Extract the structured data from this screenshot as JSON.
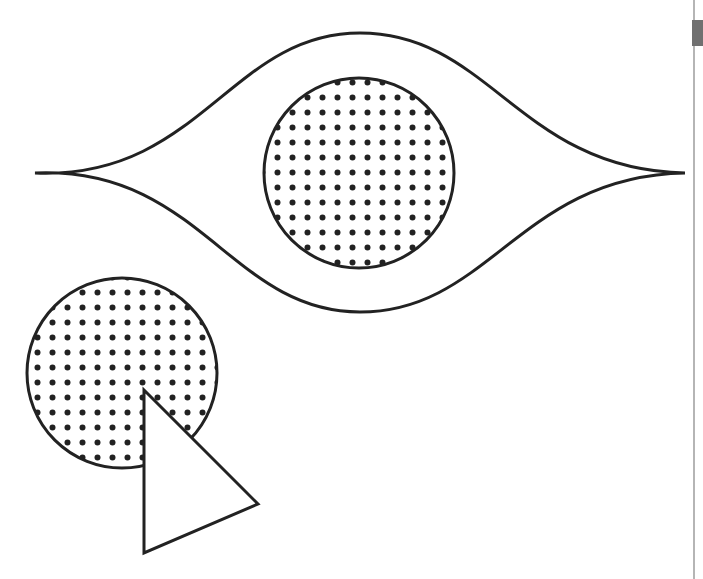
{
  "figure": {
    "colors": {
      "stroke": "#222222",
      "fill": "#ffffff",
      "dot": "#222222",
      "divider": "#b5b5b5",
      "tab": "#707070"
    },
    "shapes": [
      {
        "name": "eye-outline",
        "type": "lens",
        "left": [
          35,
          173
        ],
        "right": [
          685,
          173
        ],
        "top_y": 33,
        "bottom_y": 312
      },
      {
        "name": "eye-pupil",
        "type": "circle",
        "cx": 359,
        "cy": 173,
        "r": 95,
        "fill": "dots"
      },
      {
        "name": "dotted-circle",
        "type": "circle",
        "cx": 122,
        "cy": 373,
        "r": 95,
        "fill": "dots"
      },
      {
        "name": "triangle",
        "type": "polygon",
        "points": [
          [
            144,
            390
          ],
          [
            258,
            504
          ],
          [
            144,
            553
          ]
        ],
        "fill": "white"
      }
    ],
    "dot_spacing": 15,
    "dot_radius": 3
  }
}
